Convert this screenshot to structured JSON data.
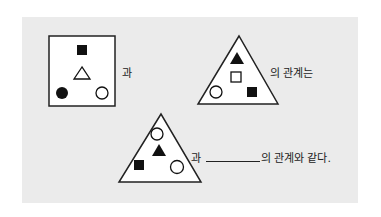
{
  "question": {
    "figure1": {
      "shape": "square",
      "items": [
        "filled-square",
        "hollow-triangle",
        "filled-circle",
        "hollow-circle"
      ]
    },
    "connector1": "과",
    "figure2": {
      "shape": "triangle",
      "items": [
        "filled-triangle",
        "hollow-square",
        "hollow-circle",
        "filled-square"
      ]
    },
    "connector2": "의 관계는",
    "figure3": {
      "shape": "triangle",
      "items": [
        "hollow-circle",
        "filled-triangle",
        "filled-square",
        "hollow-circle"
      ]
    },
    "connector3": "과",
    "suffix": "의 관계와 같다."
  }
}
